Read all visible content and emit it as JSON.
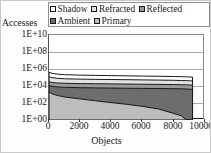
{
  "chart": {
    "type": "area",
    "ylabel": "Accesses",
    "xlabel": "Objects",
    "legend_position": "top",
    "grid": true
  },
  "legend": {
    "rows": [
      [
        {
          "label": "Shadow",
          "marker": "legend-swatch",
          "color": "#ffffff"
        },
        {
          "label": "Refracted",
          "marker": "legend-swatch",
          "color": "#e2e2e2"
        },
        {
          "label": "Reflected",
          "marker": "legend-swatch",
          "color": "#9a9a9a"
        }
      ],
      [
        {
          "label": "Ambient",
          "marker": "legend-swatch",
          "color": "#6d6d6d"
        },
        {
          "label": "Primary",
          "marker": "legend-swatch",
          "color": "#bdbdbd"
        }
      ]
    ]
  },
  "yaxis": {
    "ticks": [
      "1E+10",
      "1E+08",
      "1E+06",
      "1E+04",
      "1E+02",
      "1E+00"
    ],
    "values": [
      10000000000,
      100000000,
      1000000,
      10000,
      100,
      1
    ],
    "scale": "log",
    "min": 1,
    "max": 10000000000
  },
  "xaxis": {
    "ticks": [
      "0",
      "2000",
      "4000",
      "6000",
      "8000",
      "10000"
    ],
    "values": [
      0,
      2000,
      4000,
      6000,
      8000,
      10000
    ],
    "min": 0,
    "max": 10000
  },
  "chart_data": {
    "type": "area",
    "title": "",
    "xlabel": "Objects",
    "ylabel": "Accesses",
    "xlim": [
      0,
      10000
    ],
    "ylim": [
      1,
      10000000000
    ],
    "yscale": "log",
    "grid": true,
    "legend_position": "top",
    "stacked": true,
    "note": "Cumulative stacked log-scale ray-access counts per object, objects sorted by access count; all series truncate near 9200 objects.",
    "x": [
      0,
      200,
      500,
      1000,
      2000,
      3000,
      4000,
      5000,
      6000,
      7000,
      8000,
      8500,
      8800,
      9000,
      9200
    ],
    "series": [
      {
        "name": "Primary",
        "fill": "#bdbdbd",
        "values": [
          2000,
          1200,
          800,
          500,
          300,
          180,
          110,
          70,
          40,
          20,
          6,
          3,
          1,
          1,
          1
        ]
      },
      {
        "name": "Ambient",
        "fill": "#6d6d6d",
        "values": [
          9000,
          8000,
          7000,
          6500,
          6000,
          5800,
          5600,
          5400,
          5200,
          5000,
          4800,
          4600,
          4400,
          4200,
          4000
        ]
      },
      {
        "name": "Reflected",
        "fill": "#9a9a9a",
        "values": [
          20000,
          17000,
          15000,
          14000,
          13000,
          12500,
          12000,
          11500,
          11000,
          10500,
          10000,
          9600,
          9300,
          9000,
          8800
        ]
      },
      {
        "name": "Refracted",
        "fill": "#e2e2e2",
        "values": [
          90000,
          70000,
          58000,
          50000,
          45000,
          42000,
          40000,
          38000,
          36000,
          34000,
          32000,
          30000,
          29000,
          28000,
          27000
        ]
      },
      {
        "name": "Shadow",
        "fill": "#ffffff",
        "values": [
          300000,
          210000,
          170000,
          145000,
          125000,
          115000,
          108000,
          102000,
          96000,
          90000,
          84000,
          80000,
          77000,
          75000,
          73000
        ]
      }
    ]
  }
}
